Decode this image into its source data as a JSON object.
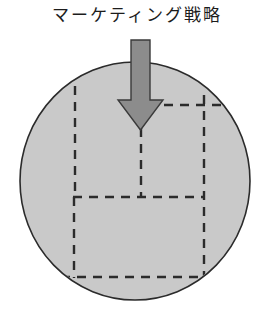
{
  "figure": {
    "title": "マーケティング戦略",
    "background_color": "#ffffff"
  },
  "circle": {
    "name": "market-circle",
    "fill_color": "#c9c9c9",
    "stroke_color": "#2b2b2b",
    "center_x": 135,
    "center_y": 181,
    "radius_x": 115,
    "radius_y": 119
  },
  "arrow": {
    "name": "strategy-arrow",
    "fill_color": "#8c8c8c",
    "stroke_color": "#3a3a3a",
    "direction": "down",
    "shaft_left": 131,
    "shaft_right": 150,
    "shaft_top": 40,
    "head_left": 118,
    "head_right": 163,
    "head_top": 100,
    "tip_y": 130
  },
  "segments": {
    "stroke_color": "#2b2b2b",
    "dash": "9 7",
    "upper_block": {
      "name": "upper-segment-block",
      "vertical_left_x": 75,
      "vertical_left_top": 72,
      "vertical_left_bottom": 197,
      "vertical_right_x": 204,
      "vertical_right_top": 97,
      "vertical_right_bottom": 277,
      "horizontal_y": 105,
      "horizontal_left": 150,
      "horizontal_right": 248
    },
    "center_line": {
      "name": "center-divider-line",
      "x": 141,
      "top": 130,
      "bottom": 197
    },
    "lower_block": {
      "name": "lower-segment-block",
      "left_x": 74,
      "right_x": 204,
      "top_y": 197,
      "bottom_y": 277,
      "bottom_left": 62,
      "bottom_right": 204,
      "top_left": 74,
      "top_right": 204
    }
  }
}
